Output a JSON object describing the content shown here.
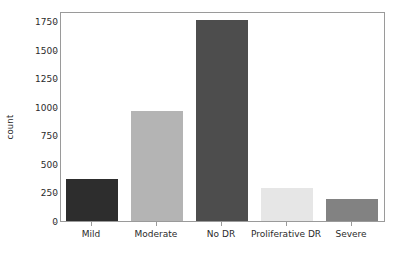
{
  "chart_data": {
    "type": "bar",
    "title": "",
    "subtitle": "",
    "xlabel": "",
    "ylabel": "count",
    "categories": [
      "Mild",
      "Moderate",
      "No DR",
      "Proliferative DR",
      "Severe"
    ],
    "values": [
      368,
      970,
      1780,
      290,
      193
    ],
    "series": [
      {
        "name": "count",
        "values": [
          368,
          970,
          1780,
          290,
          193
        ]
      }
    ],
    "bar_colors": [
      "#2d2d2d",
      "#b4b4b4",
      "#4d4d4d",
      "#e6e6e6",
      "#828282"
    ],
    "ylim": [
      0,
      1838
    ],
    "xlim": [
      -0.5,
      4.5
    ],
    "yticks": [
      0,
      250,
      500,
      750,
      1000,
      1250,
      1500,
      1750
    ],
    "ytick_labels": [
      "0",
      "250",
      "500",
      "750",
      "1000",
      "1250",
      "1500",
      "1750"
    ],
    "grid": false,
    "legend": false,
    "legend_position": "none",
    "frame": true,
    "axis_color": "#9a9a9a",
    "background": "#ffffff",
    "text_color": "#2b2b2b"
  },
  "axes": {
    "y_label_text": "count",
    "y_tick_0": "0",
    "y_tick_250": "250",
    "y_tick_500": "500",
    "y_tick_750": "750",
    "y_tick_1000": "1000",
    "y_tick_1250": "1250",
    "y_tick_1500": "1500",
    "y_tick_1750": "1750",
    "x_tick_mild": "Mild",
    "x_tick_moderate": "Moderate",
    "x_tick_nodr": "No DR",
    "x_tick_proliferative": "Proliferative DR",
    "x_tick_severe": "Severe"
  }
}
